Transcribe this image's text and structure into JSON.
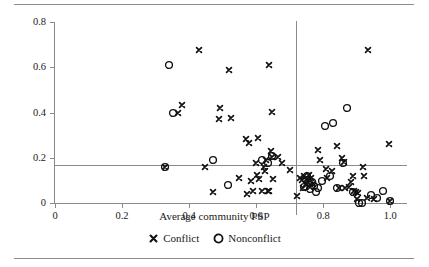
{
  "figure": {
    "xlabel": "Average community PSP",
    "ylabel": "Average community MOP"
  },
  "legend": {
    "items": [
      {
        "label": "Conflict",
        "marker": "x-marker-icon"
      },
      {
        "label": "Nonconflict",
        "marker": "circle-marker-icon"
      }
    ]
  },
  "chart_data": {
    "type": "scatter",
    "title": "",
    "xlabel": "Average community PSP",
    "ylabel": "Average community MOP",
    "xlim": [
      0,
      1.05
    ],
    "ylim": [
      0,
      0.8
    ],
    "xticks": [
      0,
      0.2,
      0.4,
      0.6,
      0.8,
      1.0
    ],
    "xticklabels": [
      "0",
      "0.2",
      "0.4",
      "0.6",
      "0.8",
      "1.0"
    ],
    "yticks": [
      0,
      0.2,
      0.4,
      0.6,
      0.8
    ],
    "yticklabels": [
      "0",
      "0.2",
      "0.4",
      "0.6",
      "0.8"
    ],
    "grid": false,
    "legend_position": "below-axes",
    "reference_lines": [
      {
        "orientation": "horizontal",
        "value": 0.17,
        "axis": "y"
      },
      {
        "orientation": "vertical",
        "value": 0.72,
        "axis": "x"
      }
    ],
    "series": [
      {
        "name": "Conflict",
        "marker": "x",
        "points": [
          [
            0.329,
            0.16
          ],
          [
            0.379,
            0.432
          ],
          [
            0.368,
            0.397
          ],
          [
            0.43,
            0.676
          ],
          [
            0.447,
            0.16
          ],
          [
            0.47,
            0.047
          ],
          [
            0.489,
            0.37
          ],
          [
            0.493,
            0.42
          ],
          [
            0.519,
            0.588
          ],
          [
            0.525,
            0.377
          ],
          [
            0.548,
            0.112
          ],
          [
            0.571,
            0.285
          ],
          [
            0.572,
            0.041
          ],
          [
            0.578,
            0.265
          ],
          [
            0.585,
            0.098
          ],
          [
            0.592,
            0.052
          ],
          [
            0.6,
            0.175
          ],
          [
            0.602,
            0.122
          ],
          [
            0.606,
            0.288
          ],
          [
            0.608,
            0.105
          ],
          [
            0.617,
            0.052
          ],
          [
            0.622,
            0.158
          ],
          [
            0.626,
            0.14
          ],
          [
            0.63,
            0.192
          ],
          [
            0.634,
            0.052
          ],
          [
            0.637,
            0.608
          ],
          [
            0.639,
            0.052
          ],
          [
            0.644,
            0.23
          ],
          [
            0.646,
            0.205
          ],
          [
            0.648,
            0.402
          ],
          [
            0.65,
            0.108
          ],
          [
            0.666,
            0.203
          ],
          [
            0.676,
            0.178
          ],
          [
            0.7,
            0.148
          ],
          [
            0.722,
            0.03
          ],
          [
            0.73,
            0.112
          ],
          [
            0.737,
            0.102
          ],
          [
            0.741,
            0.068
          ],
          [
            0.744,
            0.118
          ],
          [
            0.748,
            0.082
          ],
          [
            0.752,
            0.105
          ],
          [
            0.755,
            0.095
          ],
          [
            0.757,
            0.125
          ],
          [
            0.76,
            0.072
          ],
          [
            0.765,
            0.112
          ],
          [
            0.77,
            0.085
          ],
          [
            0.786,
            0.235
          ],
          [
            0.79,
            0.192
          ],
          [
            0.808,
            0.15
          ],
          [
            0.812,
            0.112
          ],
          [
            0.826,
            0.14
          ],
          [
            0.84,
            0.25
          ],
          [
            0.848,
            0.065
          ],
          [
            0.856,
            0.2
          ],
          [
            0.862,
            0.183
          ],
          [
            0.866,
            0.068
          ],
          [
            0.878,
            0.072
          ],
          [
            0.884,
            0.092
          ],
          [
            0.888,
            0.118
          ],
          [
            0.892,
            0.055
          ],
          [
            0.898,
            0.05
          ],
          [
            0.9,
            0.018
          ],
          [
            0.905,
            0.042
          ],
          [
            0.918,
            0.16
          ],
          [
            0.922,
            0.118
          ],
          [
            0.93,
            0.022
          ],
          [
            0.934,
            0.676
          ],
          [
            0.952,
            0.018
          ],
          [
            0.997,
            0.26
          ],
          [
            1.0,
            0.01
          ]
        ]
      },
      {
        "name": "Nonconflict",
        "marker": "o",
        "points": [
          [
            0.329,
            0.16
          ],
          [
            0.34,
            0.61
          ],
          [
            0.352,
            0.397
          ],
          [
            0.47,
            0.188
          ],
          [
            0.515,
            0.078
          ],
          [
            0.618,
            0.188
          ],
          [
            0.636,
            0.175
          ],
          [
            0.647,
            0.208
          ],
          [
            0.742,
            0.07
          ],
          [
            0.749,
            0.1
          ],
          [
            0.753,
            0.12
          ],
          [
            0.758,
            0.088
          ],
          [
            0.762,
            0.062
          ],
          [
            0.766,
            0.092
          ],
          [
            0.773,
            0.075
          ],
          [
            0.78,
            0.05
          ],
          [
            0.786,
            0.068
          ],
          [
            0.796,
            0.098
          ],
          [
            0.806,
            0.34
          ],
          [
            0.82,
            0.12
          ],
          [
            0.828,
            0.355
          ],
          [
            0.842,
            0.068
          ],
          [
            0.858,
            0.175
          ],
          [
            0.872,
            0.42
          ],
          [
            0.89,
            0.048
          ],
          [
            0.908,
            0.0
          ],
          [
            0.915,
            0.0
          ],
          [
            0.944,
            0.035
          ],
          [
            0.962,
            0.02
          ],
          [
            0.978,
            0.055
          ],
          [
            1.0,
            0.01
          ]
        ]
      }
    ]
  }
}
